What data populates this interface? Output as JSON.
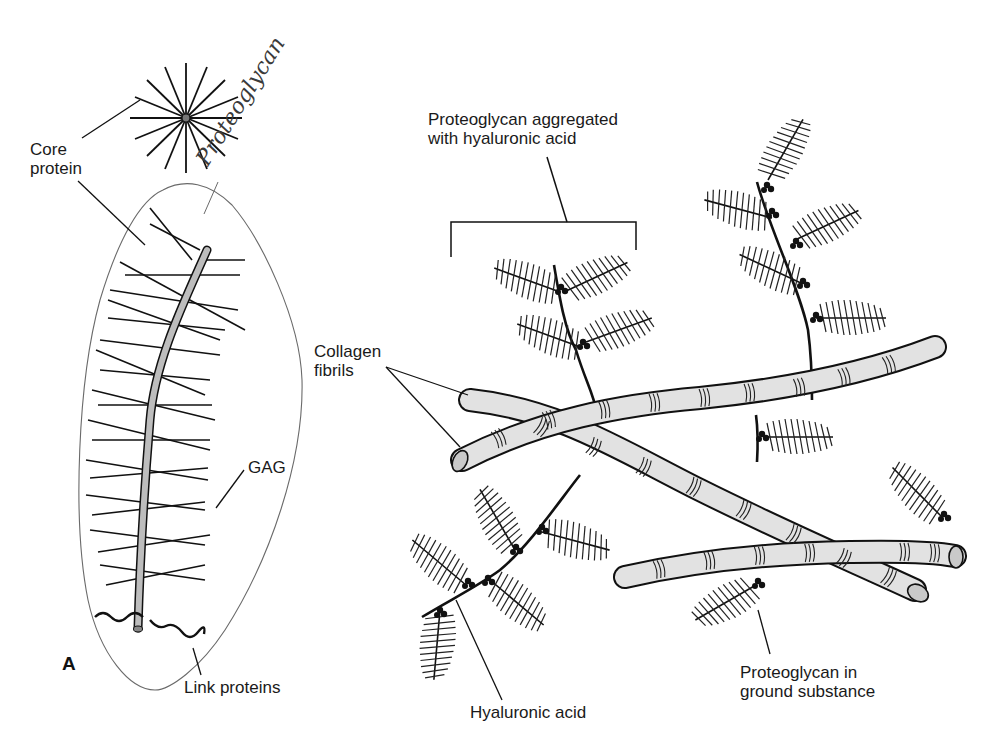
{
  "figure": {
    "panel_letter": "A",
    "handwritten_annotation": "Proteoglycan",
    "labels": {
      "core_protein": "Core\nprotein",
      "gag": "GAG",
      "link_proteins": "Link proteins",
      "aggregate": "Proteoglycan aggregated\nwith hyaluronic acid",
      "collagen": "Collagen\nfibrils",
      "hyaluronic_acid": "Hyaluronic acid",
      "ground_substance": "Proteoglycan in\nground substance"
    },
    "colors": {
      "ink": "#111111",
      "fibril_fill": "#e2e2e2",
      "core_fill": "#bdbdbd",
      "outline_pencil": "#6a6a6a"
    }
  }
}
